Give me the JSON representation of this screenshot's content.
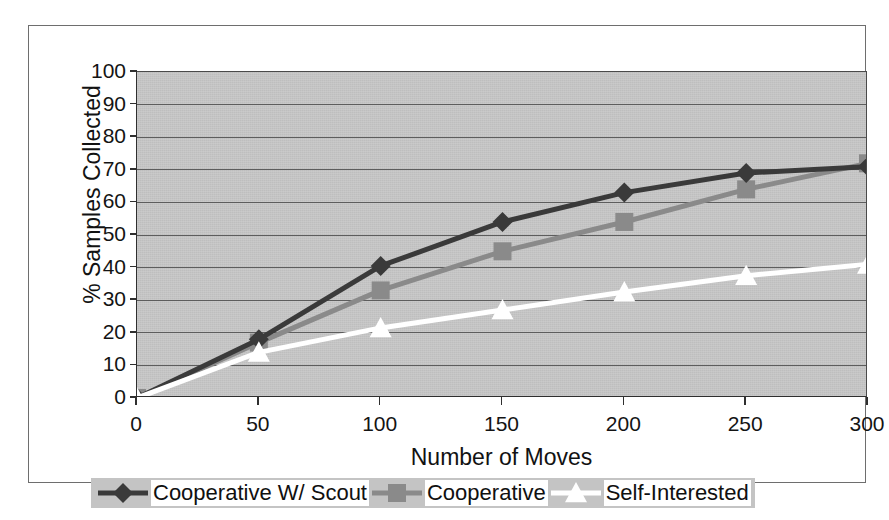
{
  "chart_data": {
    "type": "line",
    "title": "",
    "xlabel": "Number of Moves",
    "ylabel": "% Samples Collected",
    "x": [
      0,
      50,
      100,
      150,
      200,
      250,
      300
    ],
    "xlim": [
      0,
      300
    ],
    "ylim": [
      0,
      100
    ],
    "xticks": [
      "0",
      "50",
      "100",
      "150",
      "200",
      "250",
      "300"
    ],
    "yticks": [
      "0",
      "10",
      "20",
      "30",
      "40",
      "50",
      "60",
      "70",
      "80",
      "90",
      "100"
    ],
    "grid": "horizontal",
    "legend_position": "bottom",
    "plot_background": "#c3c3c3",
    "series": [
      {
        "name": "Cooperative W/ Scout",
        "marker": "diamond",
        "color": "#3a3a3a",
        "values": [
          0,
          18,
          40.5,
          54,
          63,
          69,
          71
        ]
      },
      {
        "name": "Cooperative",
        "marker": "square",
        "color": "#8a8a8a",
        "values": [
          0,
          17,
          33,
          45,
          54,
          64,
          72
        ]
      },
      {
        "name": "Self-Interested",
        "marker": "triangle",
        "color": "#ffffff",
        "values": [
          0,
          14,
          21.5,
          27,
          32.5,
          37.5,
          41
        ]
      }
    ]
  },
  "axis": {
    "x_title": "Number of Moves",
    "y_title": "% Samples Collected"
  },
  "legend": {
    "entries": [
      {
        "label": "Cooperative W/ Scout",
        "marker": "diamond",
        "color": "#3a3a3a"
      },
      {
        "label": "Cooperative",
        "marker": "square",
        "color": "#8a8a8a"
      },
      {
        "label": "Self-Interested",
        "marker": "triangle",
        "color": "#ffffff"
      }
    ]
  }
}
